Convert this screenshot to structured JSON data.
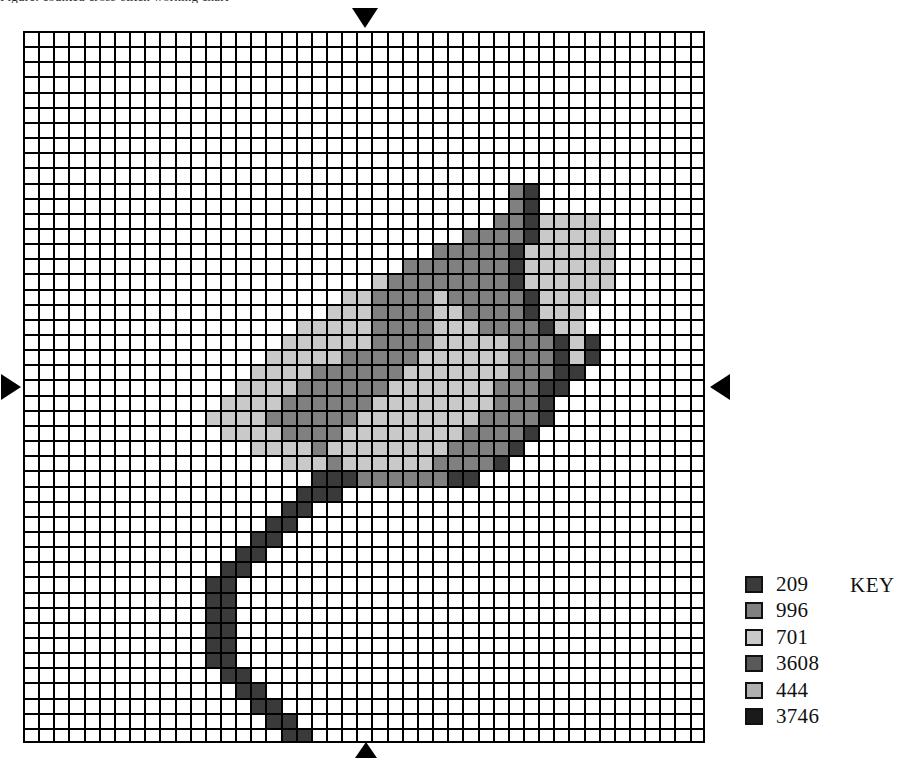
{
  "caption": {
    "text": "Figure: counted cross-stitch working chart"
  },
  "chart": {
    "type": "cross-stitch-grid",
    "columns": 45,
    "rows": 47,
    "cell_px": 15.15,
    "origin": {
      "x": 23,
      "y": 31
    },
    "grid_line_color": "#000000",
    "background": "#ffffff",
    "palette": {
      "0": "#ffffff",
      "1": "#3a3a3a",
      "2": "#808080",
      "3": "#c9c9c9",
      "4": "#595959",
      "5": "#b0b0b0",
      "6": "#1a1a1a"
    },
    "rows_data": [
      "000000000000000000000000000000000000000000000",
      "000000000000000000000000000000000000000000000",
      "000000000000000000000000000000000000000000000",
      "000000000000000000000000000000000000000000000",
      "000000000000000000000000000000000000000000000",
      "000000000000000000000000000000000000000000000",
      "000000000000000000000000000000000000000000000",
      "000000000000000000000000000000000000000000000",
      "000000000000000000000000000000000000000000000",
      "000000000000000000000000000000000000000000000",
      "000000000000000000000000000000002100000000000",
      "000000000000000000000000000000002100000000000",
      "000000000000000000000000000000022133330000000",
      "000000000000000000000000000002222133333000000",
      "000000000000000000000000000222221333333000000",
      "000000000000000000000000022222221333333000000",
      "000000000000000000000003222222221333333000000",
      "000000000000000000000332222322222133330000000",
      "000000000000000000003332222332222133300000000",
      "000000000000000000333332222333222213300000000",
      "000000000000000003333332222333332221310000000",
      "000000000000000033333222223333332221310000000",
      "000000000000000333322222233333332221100000000",
      "000000000000003333222222333333322211000000000",
      "000000000000033332222223333333322210000000000",
      "000000000000333322222233333333222210000000000",
      "000000000000033332222333333332222100000000000",
      "000000000000000333323333333322221000000000000",
      "000000000000000003332333333222210000000000000",
      "000000000000000000011122222211000000000000000",
      "000000000000000000111000000000000000000000000",
      "000000000000000001100000000000000000000000000",
      "000000000000000011000000000000000000000000000",
      "000000000000000110000000000000000000000000000",
      "000000000000001100000000000000000000000000000",
      "000000000000011000000000000000000000000000000",
      "000000000000110000000000000000000000000000000",
      "000000000000110000000000000000000000000000000",
      "000000000000110000000000000000000000000000000",
      "000000000000110000000000000000000000000000000",
      "000000000000110000000000000000000000000000000",
      "000000000000110000000000000000000000000000000",
      "000000000000011000000000000000000000000000000",
      "000000000000001100000000000000000000000000000",
      "000000000000000110000000000000000000000000000",
      "000000000000000011000000000000000000000000000",
      "000000000000000001100000000000000000000000000"
    ]
  },
  "markers": {
    "top": "center-marker-down",
    "bottom": "center-marker-up",
    "left": "center-marker-right",
    "right": "center-marker-left"
  },
  "legend": {
    "title": "KEY",
    "entries": [
      {
        "code": "209",
        "color": "#3a3a3a"
      },
      {
        "code": "996",
        "color": "#808080"
      },
      {
        "code": "701",
        "color": "#c9c9c9"
      },
      {
        "code": "3608",
        "color": "#595959"
      },
      {
        "code": "444",
        "color": "#b0b0b0"
      },
      {
        "code": "3746",
        "color": "#1a1a1a"
      }
    ]
  }
}
